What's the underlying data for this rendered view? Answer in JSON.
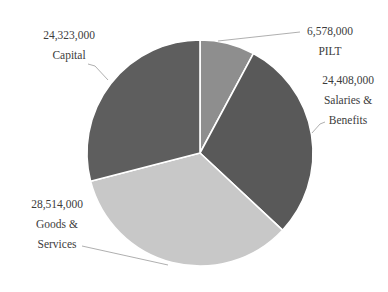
{
  "chart_data": {
    "type": "pie",
    "title": "",
    "start_angle_deg": 0,
    "direction": "clockwise",
    "slices": [
      {
        "label": "PILT",
        "value": 6578000,
        "value_label": "6,578,000",
        "color": "#8e8e8e"
      },
      {
        "label": "Salaries & Benefits",
        "value": 24408000,
        "value_label": "24,408,000",
        "color": "#595959"
      },
      {
        "label": "Goods & Services",
        "value": 28514000,
        "value_label": "28,514,000",
        "color": "#c8c8c8"
      },
      {
        "label": "Capital",
        "value": 24323000,
        "value_label": "24,323,000",
        "color": "#5e5e5e"
      }
    ],
    "legend": "none",
    "data_labels": "outside with leader lines"
  },
  "labels": {
    "pilt": {
      "value": "6,578,000",
      "line1": "PILT"
    },
    "salaries": {
      "value": "24,408,000",
      "line1": "Salaries &",
      "line2": "Benefits"
    },
    "goods": {
      "value": "28,514,000",
      "line1": "Goods &",
      "line2": "Services"
    },
    "capital": {
      "value": "24,323,000",
      "line1": "Capital"
    }
  }
}
